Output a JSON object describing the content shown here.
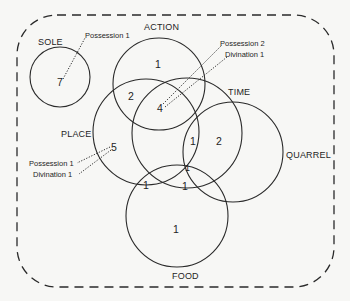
{
  "diagram": {
    "type": "venn",
    "colors": {
      "background": "#f7f7f5",
      "ink": "#2a2a2a"
    },
    "frame": {
      "style": "dashed rounded rectangle"
    },
    "sets": [
      {
        "id": "sole",
        "label": "SOLE"
      },
      {
        "id": "action",
        "label": "ACTION"
      },
      {
        "id": "place",
        "label": "PLACE"
      },
      {
        "id": "time",
        "label": "TIME"
      },
      {
        "id": "quarrel",
        "label": "QUARREL"
      },
      {
        "id": "food",
        "label": "FOOD"
      }
    ],
    "regions": [
      {
        "sets": [
          "sole"
        ],
        "count": "7",
        "annotations": [
          "Possession 1"
        ]
      },
      {
        "sets": [
          "action"
        ],
        "count": "1"
      },
      {
        "sets": [
          "action",
          "place"
        ],
        "count": "2"
      },
      {
        "sets": [
          "action",
          "place",
          "time"
        ],
        "count": "4",
        "annotations": [
          "Possession 2",
          "Divination 1"
        ]
      },
      {
        "sets": [
          "place"
        ],
        "count": "5",
        "annotations": [
          "Possession 1",
          "Divination 1"
        ]
      },
      {
        "sets": [
          "time",
          "quarrel"
        ],
        "count": "1"
      },
      {
        "sets": [
          "quarrel"
        ],
        "count": "2"
      },
      {
        "sets": [
          "place",
          "time",
          "quarrel",
          "food"
        ],
        "count": "1"
      },
      {
        "sets": [
          "place",
          "food"
        ],
        "count": "1"
      },
      {
        "sets": [
          "place",
          "time",
          "food"
        ],
        "count": "1"
      },
      {
        "sets": [
          "food"
        ],
        "count": "1"
      }
    ],
    "labels": {
      "sole": "SOLE",
      "action": "ACTION",
      "place": "PLACE",
      "time": "TIME",
      "quarrel": "QUARREL",
      "food": "FOOD"
    },
    "counts": {
      "sole_only": "7",
      "action_only": "1",
      "action_place": "2",
      "action_place_time": "4",
      "place_only": "5",
      "time_quarrel": "1",
      "quarrel_only": "2",
      "place_time_quarrel_food": "1",
      "place_food": "1",
      "place_time_food": "1",
      "food_only": "1"
    },
    "annotations": {
      "sole_possession": "Possession 1",
      "center_possession": "Possession 2",
      "center_divination": "Divination 1",
      "place_possession": "Possession 1",
      "place_divination": "Divination 1"
    }
  }
}
